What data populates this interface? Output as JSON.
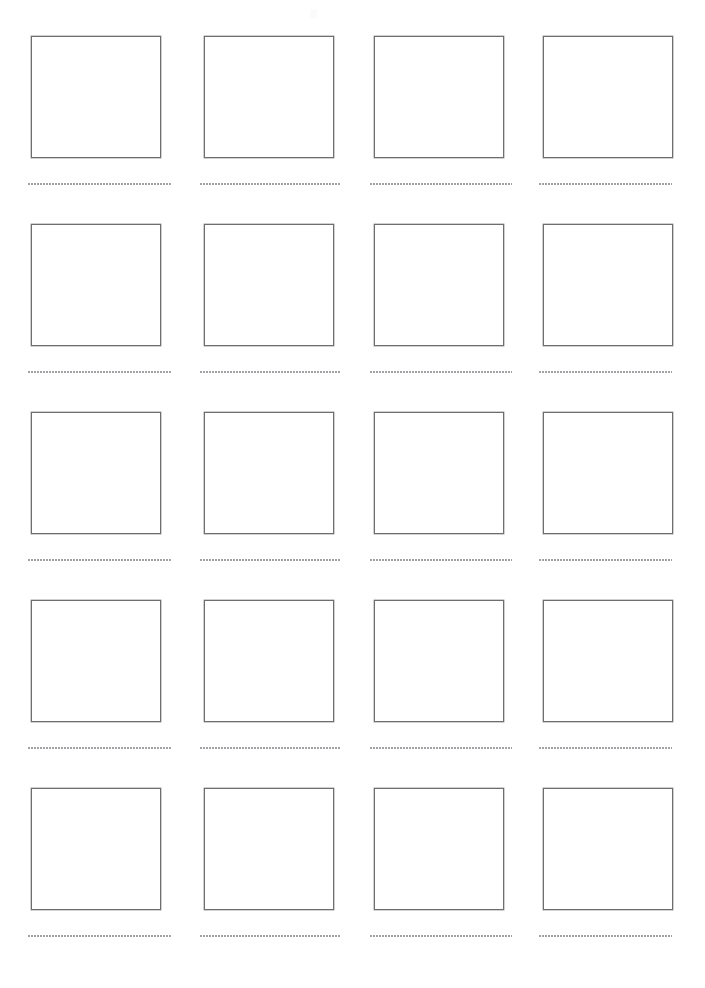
{
  "page": {
    "width": 705,
    "height": 988,
    "background_color": "#ffffff",
    "paper_kind": "scanned-blank-worksheet"
  },
  "style": {
    "box_border_color": "#6e6e70",
    "box_fill_color": "#ffffff",
    "writing_line_color": "#9a9a9e",
    "artifact_color": "#fbfbfc"
  },
  "grid": {
    "columns": 4,
    "rows": 5,
    "cell_count": 20,
    "box_width": 130,
    "box_height": 122,
    "column_left_edges": [
      31,
      204,
      374,
      543
    ],
    "row_top_edges": [
      36,
      224,
      412,
      600,
      788
    ],
    "writing_line_tops": [
      183,
      371,
      559,
      747,
      935
    ],
    "writing_line_lefts": [
      28,
      200,
      370,
      539
    ],
    "writing_line_widths": [
      144,
      140,
      142,
      133
    ]
  },
  "artifact": {
    "name": "faint-scan-mark",
    "left": 310,
    "top": 9,
    "visible": true
  },
  "cells": [
    {
      "id": "cell-r1c1",
      "row": 1,
      "column": 1,
      "label": ""
    },
    {
      "id": "cell-r1c2",
      "row": 1,
      "column": 2,
      "label": ""
    },
    {
      "id": "cell-r1c3",
      "row": 1,
      "column": 3,
      "label": ""
    },
    {
      "id": "cell-r1c4",
      "row": 1,
      "column": 4,
      "label": ""
    },
    {
      "id": "cell-r2c1",
      "row": 2,
      "column": 1,
      "label": ""
    },
    {
      "id": "cell-r2c2",
      "row": 2,
      "column": 2,
      "label": ""
    },
    {
      "id": "cell-r2c3",
      "row": 2,
      "column": 3,
      "label": ""
    },
    {
      "id": "cell-r2c4",
      "row": 2,
      "column": 4,
      "label": ""
    },
    {
      "id": "cell-r3c1",
      "row": 3,
      "column": 1,
      "label": ""
    },
    {
      "id": "cell-r3c2",
      "row": 3,
      "column": 2,
      "label": ""
    },
    {
      "id": "cell-r3c3",
      "row": 3,
      "column": 3,
      "label": ""
    },
    {
      "id": "cell-r3c4",
      "row": 3,
      "column": 4,
      "label": ""
    },
    {
      "id": "cell-r4c1",
      "row": 4,
      "column": 1,
      "label": ""
    },
    {
      "id": "cell-r4c2",
      "row": 4,
      "column": 2,
      "label": ""
    },
    {
      "id": "cell-r4c3",
      "row": 4,
      "column": 3,
      "label": ""
    },
    {
      "id": "cell-r4c4",
      "row": 4,
      "column": 4,
      "label": ""
    },
    {
      "id": "cell-r5c1",
      "row": 5,
      "column": 1,
      "label": ""
    },
    {
      "id": "cell-r5c2",
      "row": 5,
      "column": 2,
      "label": ""
    },
    {
      "id": "cell-r5c3",
      "row": 5,
      "column": 3,
      "label": ""
    },
    {
      "id": "cell-r5c4",
      "row": 5,
      "column": 4,
      "label": ""
    }
  ]
}
